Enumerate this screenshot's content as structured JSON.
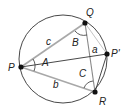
{
  "diagram": {
    "type": "inscribed-triangle-circle",
    "circle": {
      "cx": 63,
      "cy": 59,
      "r": 44,
      "stroke": "#333333"
    },
    "points": {
      "P": {
        "x": 21,
        "y": 67,
        "label": "P",
        "lx": 8,
        "ly": 71
      },
      "Q": {
        "x": 85,
        "y": 23,
        "label": "Q",
        "lx": 86,
        "ly": 16
      },
      "R": {
        "x": 95,
        "y": 92,
        "label": "R",
        "lx": 99,
        "ly": 105
      },
      "P2": {
        "x": 107,
        "y": 54,
        "label": "P'",
        "lx": 111,
        "ly": 57
      }
    },
    "sides": {
      "a": {
        "label": "a",
        "lx": 92,
        "ly": 53
      },
      "b": {
        "label": "b",
        "lx": 53,
        "ly": 88
      },
      "c": {
        "label": "c",
        "lx": 46,
        "ly": 45
      }
    },
    "angles": {
      "A": {
        "label": "A",
        "lx": 42,
        "ly": 66
      },
      "B": {
        "label": "B",
        "lx": 72,
        "ly": 46
      },
      "C": {
        "label": "C",
        "lx": 79,
        "ly": 77
      }
    },
    "colors": {
      "dark_line": "#333333",
      "light_line": "#a0a0a0",
      "point_fill": "#111111"
    }
  }
}
